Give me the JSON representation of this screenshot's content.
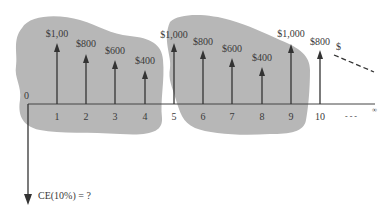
{
  "diagram": {
    "type": "cash-flow-diagram",
    "origin_label": "0",
    "periods": [
      "1",
      "2",
      "3",
      "4",
      "5",
      "6",
      "7",
      "8",
      "9",
      "10"
    ],
    "ellipsis": "- - -",
    "infinity_mark": "∞",
    "cash_flows": [
      {
        "period": 1,
        "label": "$1,00",
        "amount": 1000
      },
      {
        "period": 2,
        "label": "$800",
        "amount": 800
      },
      {
        "period": 3,
        "label": "$600",
        "amount": 600
      },
      {
        "period": 4,
        "label": "$400",
        "amount": 400
      },
      {
        "period": 5,
        "label": "$1,000",
        "amount": 1000
      },
      {
        "period": 6,
        "label": "$800",
        "amount": 800
      },
      {
        "period": 7,
        "label": "$600",
        "amount": 600
      },
      {
        "period": 8,
        "label": "$400",
        "amount": 400
      },
      {
        "period": 9,
        "label": "$1,000",
        "amount": 1000
      },
      {
        "period": 10,
        "label": "$800",
        "amount": 800
      }
    ],
    "continuation_label": "$",
    "result_label": "CE(10%) = ?",
    "colors": {
      "cloud": "#b7b7b7",
      "arrow": "#333333",
      "axis": "#444444"
    }
  }
}
